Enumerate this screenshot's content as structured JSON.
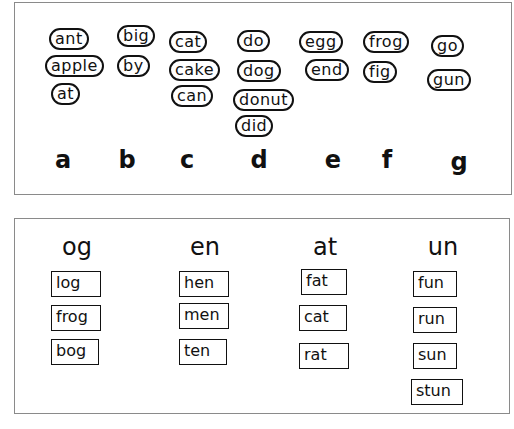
{
  "top_sheet": {
    "groups": [
      {
        "letter": "a",
        "words": [
          "ant",
          "apple",
          "at"
        ]
      },
      {
        "letter": "b",
        "words": [
          "big",
          "by"
        ]
      },
      {
        "letter": "c",
        "words": [
          "cat",
          "cake",
          "can"
        ]
      },
      {
        "letter": "d",
        "words": [
          "do",
          "dog",
          "donut",
          "did"
        ]
      },
      {
        "letter": "e",
        "words": [
          "egg",
          "end"
        ]
      },
      {
        "letter": "f",
        "words": [
          "frog",
          "fig"
        ]
      },
      {
        "letter": "g",
        "words": [
          "go",
          "gun"
        ]
      }
    ]
  },
  "bottom_sheet": {
    "columns": [
      {
        "heading": "og",
        "words": [
          "log",
          "frog",
          "bog"
        ]
      },
      {
        "heading": "en",
        "words": [
          "hen",
          "men",
          "ten"
        ]
      },
      {
        "heading": "at",
        "words": [
          "fat",
          "cat",
          "rat"
        ]
      },
      {
        "heading": "un",
        "words": [
          "fun",
          "run",
          "sun",
          "stun"
        ]
      }
    ]
  }
}
